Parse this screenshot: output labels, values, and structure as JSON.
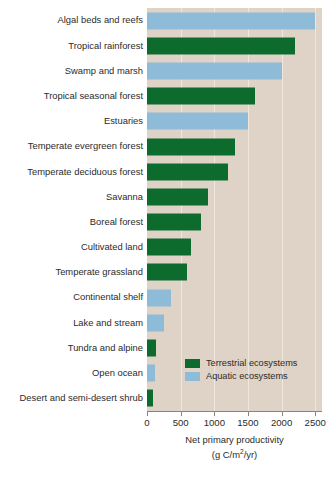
{
  "chart_data": {
    "type": "bar",
    "orientation": "horizontal",
    "title": "",
    "xlabel": "Net primary productivity",
    "xunits": "(g C/m2/yr)",
    "ylabel": "",
    "xlim": [
      0,
      2600
    ],
    "xticks": [
      0,
      500,
      1000,
      1500,
      2000,
      2500
    ],
    "xticklabels": [
      "0",
      "500",
      "1000",
      "1500",
      "2000",
      "2500"
    ],
    "grid": true,
    "legend_position": "lower-right-inside",
    "categories": [
      "Algal beds and reefs",
      "Tropical rainforest",
      "Swamp and marsh",
      "Tropical seasonal forest",
      "Estuaries",
      "Temperate evergreen forest",
      "Temperate deciduous forest",
      "Savanna",
      "Boreal forest",
      "Cultivated land",
      "Temperate grassland",
      "Continental shelf",
      "Lake and stream",
      "Tundra and alpine",
      "Open ocean",
      "Desert and semi-desert shrub"
    ],
    "values": [
      2500,
      2200,
      2000,
      1600,
      1500,
      1300,
      1200,
      900,
      800,
      650,
      600,
      360,
      250,
      140,
      125,
      90
    ],
    "groups": [
      "aquatic",
      "terrestrial",
      "aquatic",
      "terrestrial",
      "aquatic",
      "terrestrial",
      "terrestrial",
      "terrestrial",
      "terrestrial",
      "terrestrial",
      "terrestrial",
      "aquatic",
      "aquatic",
      "terrestrial",
      "aquatic",
      "terrestrial"
    ],
    "series": [
      {
        "name": "Terrestrial ecosystems",
        "color": "#0d6b2e",
        "points": [
          {
            "category": "Tropical rainforest",
            "value": 2200
          },
          {
            "category": "Tropical seasonal forest",
            "value": 1600
          },
          {
            "category": "Temperate evergreen forest",
            "value": 1300
          },
          {
            "category": "Temperate deciduous forest",
            "value": 1200
          },
          {
            "category": "Savanna",
            "value": 900
          },
          {
            "category": "Boreal forest",
            "value": 800
          },
          {
            "category": "Cultivated land",
            "value": 650
          },
          {
            "category": "Temperate grassland",
            "value": 600
          },
          {
            "category": "Tundra and alpine",
            "value": 140
          },
          {
            "category": "Desert and semi-desert shrub",
            "value": 90
          }
        ]
      },
      {
        "name": "Aquatic ecosystems",
        "color": "#8ebcd8",
        "points": [
          {
            "category": "Algal beds and reefs",
            "value": 2500
          },
          {
            "category": "Swamp and marsh",
            "value": 2000
          },
          {
            "category": "Estuaries",
            "value": 1500
          },
          {
            "category": "Continental shelf",
            "value": 360
          },
          {
            "category": "Lake and stream",
            "value": 250
          },
          {
            "category": "Open ocean",
            "value": 125
          }
        ]
      }
    ]
  },
  "legend": {
    "items": [
      {
        "label": "Terrestrial ecosystems",
        "color": "#0d6b2e",
        "key": "terrestrial"
      },
      {
        "label": "Aquatic ecosystems",
        "color": "#8ebcd8",
        "key": "aquatic"
      }
    ]
  },
  "axis": {
    "title": "Net primary productivity",
    "units_prefix": "(g C/m",
    "units_exponent": "2",
    "units_suffix": "/yr)"
  },
  "colors": {
    "terrestrial": "#0d6b2e",
    "aquatic": "#8ebcd8",
    "plot_background": "#ded3c6",
    "gridline": "#efe7dc",
    "axis": "#8a8378",
    "text": "#2b2b2b",
    "page_background": "#ffffff"
  }
}
